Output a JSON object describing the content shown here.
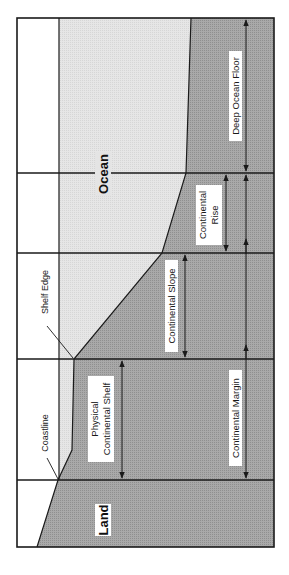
{
  "diagram": {
    "colors": {
      "background": "#ffffff",
      "ocean_fill": "#e4e4e4",
      "seabed_fill": "#a9a9a9",
      "line": "#1a1a1a",
      "label_bg": "#ffffff"
    },
    "labels": {
      "land": "Land",
      "ocean": "Ocean",
      "coastline": "Coastline",
      "shelf_edge": "Shelf Edge",
      "physical_shelf_line1": "Physical",
      "physical_shelf_line2": "Continental Shelf",
      "continental_slope": "Continental Slope",
      "continental_rise_line1": "Continental",
      "continental_rise_line2": "Rise",
      "continental_margin": "Continental Margin",
      "deep_ocean_floor": "Deep Ocean Floor"
    },
    "zones": [
      {
        "name": "Physical Continental Shelf",
        "from_y": 359,
        "to_y": 480
      },
      {
        "name": "Continental Slope",
        "from_y": 253,
        "to_y": 359
      },
      {
        "name": "Continental Rise",
        "from_y": 173,
        "to_y": 253
      },
      {
        "name": "Deep Ocean Floor",
        "from_y": 18,
        "to_y": 173
      },
      {
        "name": "Continental Margin",
        "from_y": 173,
        "to_y": 480
      }
    ]
  }
}
